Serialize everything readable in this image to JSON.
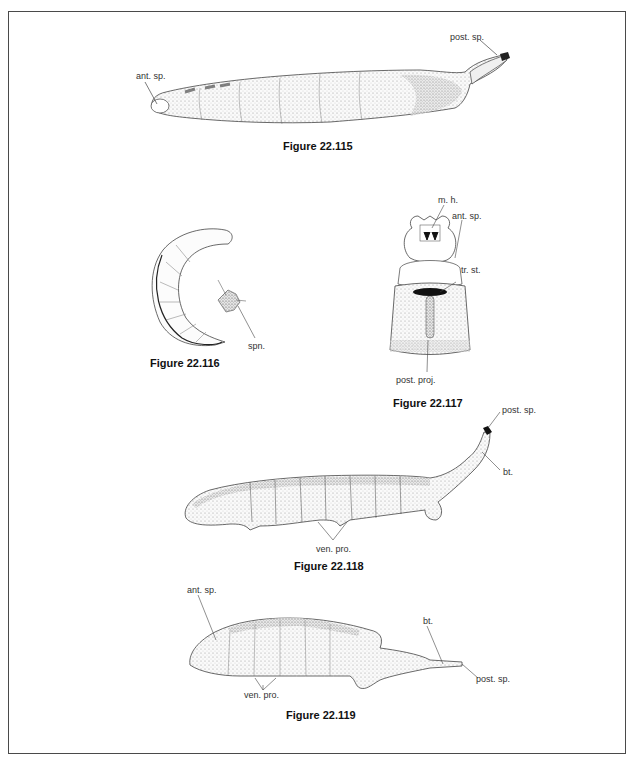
{
  "figures": [
    {
      "id": "fig-22-115",
      "caption": "Figure 22.115",
      "labels": [
        "ant. sp.",
        "post. sp."
      ]
    },
    {
      "id": "fig-22-116",
      "caption": "Figure 22.116",
      "labels": [
        "spn."
      ]
    },
    {
      "id": "fig-22-117",
      "caption": "Figure 22.117",
      "labels": [
        "m. h.",
        "ant. sp.",
        "tr. st.",
        "post. proj."
      ]
    },
    {
      "id": "fig-22-118",
      "caption": "Figure 22.118",
      "labels": [
        "post. sp.",
        "bt.",
        "ven. pro."
      ]
    },
    {
      "id": "fig-22-119",
      "caption": "Figure 22.119",
      "labels": [
        "ant. sp.",
        "bt.",
        "ven. pro.",
        "post. sp."
      ]
    }
  ]
}
